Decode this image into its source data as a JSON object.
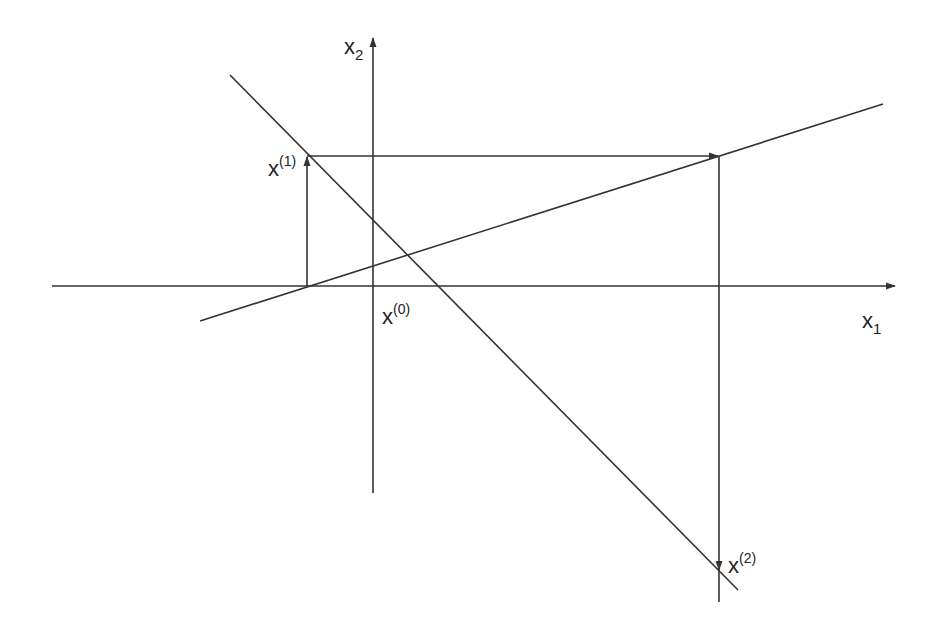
{
  "diagram": {
    "axes": {
      "x_axis": {
        "label_base": "x",
        "label_sub": "1"
      },
      "y_axis": {
        "label_base": "x",
        "label_sub": "2"
      }
    },
    "points": [
      {
        "id": "x0",
        "label_base": "x",
        "label_sup": "(0)"
      },
      {
        "id": "x1",
        "label_base": "x",
        "label_sup": "(1)"
      },
      {
        "id": "x2",
        "label_base": "x",
        "label_sup": "(2)"
      }
    ],
    "lines": [
      {
        "id": "line-descending",
        "from": [
          230,
          75
        ],
        "to": [
          738,
          590
        ]
      },
      {
        "id": "line-ascending",
        "from": [
          200,
          321
        ],
        "to": [
          883,
          104
        ]
      }
    ],
    "colors": {
      "stroke": "#333333",
      "background": "#ffffff"
    }
  }
}
